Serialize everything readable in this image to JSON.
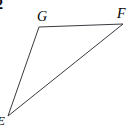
{
  "figure": {
    "problem_number": "2",
    "background_color": "#ffffff",
    "stroke_color": "#3a3a42",
    "stroke_width": 1,
    "width": 128,
    "height": 127,
    "shape_type": "triangle",
    "vertices": [
      {
        "name": "G",
        "label": "G",
        "x": 39,
        "y": 27,
        "label_x": 37,
        "label_y": 10
      },
      {
        "name": "F",
        "label": "F",
        "x": 123,
        "y": 24,
        "label_x": 117,
        "label_y": 7
      },
      {
        "name": "E",
        "label": "E",
        "x": 8,
        "y": 116,
        "label_x": -3,
        "label_y": 114
      }
    ],
    "edges": [
      {
        "name": "GF",
        "from": "G",
        "to": "F"
      },
      {
        "name": "FE",
        "from": "F",
        "to": "E"
      },
      {
        "name": "EG",
        "from": "E",
        "to": "G"
      }
    ],
    "polygon_points": "39,27 123,24 8,116"
  }
}
